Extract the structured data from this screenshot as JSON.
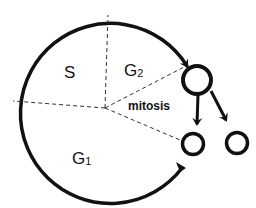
{
  "diagram": {
    "phases": [
      {
        "id": "S",
        "label": "S",
        "sub": ""
      },
      {
        "id": "G2",
        "label": "G",
        "sub": "2"
      },
      {
        "id": "G1",
        "label": "G",
        "sub": "1"
      }
    ],
    "mitosis_label": "mitosis",
    "cells": [
      {
        "id": "parent-cell",
        "role": "dividing cell"
      },
      {
        "id": "daughter-cell-left",
        "role": "daughter cell"
      },
      {
        "id": "daughter-cell-right",
        "role": "daughter cell"
      }
    ],
    "colors": {
      "stroke": "#111111",
      "dashed": "#333333",
      "background": "#ffffff"
    }
  }
}
